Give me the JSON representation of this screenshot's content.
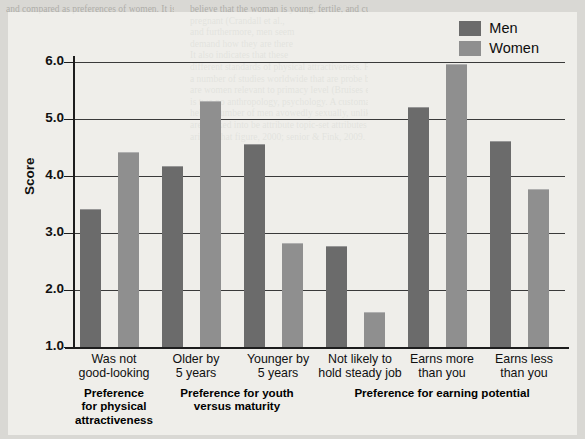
{
  "chart_data": {
    "type": "bar",
    "title": "",
    "xlabel": "",
    "ylabel": "Score",
    "ylim": [
      1.0,
      6.0
    ],
    "ytick_labels": [
      "6.0",
      "5.0",
      "4.0",
      "3.0",
      "2.0",
      "1.0"
    ],
    "ytick_values": [
      6.0,
      5.0,
      4.0,
      3.0,
      2.0,
      1.0
    ],
    "grid": "horizontal",
    "legend_position": "top-right",
    "categories": [
      "Was not good-looking",
      "Older by 5 years",
      "Younger by 5 years",
      "Not likely to hold steady job",
      "Earns more than you",
      "Earns less than you"
    ],
    "category_lines": [
      [
        "Was not",
        "good-looking"
      ],
      [
        "Older by",
        "5 years"
      ],
      [
        "Younger by",
        "5 years"
      ],
      [
        "Not likely to",
        "hold steady job"
      ],
      [
        "Earns more",
        "than you"
      ],
      [
        "Earns less",
        "than you"
      ]
    ],
    "series": [
      {
        "name": "Men",
        "color": "#6b6b6b",
        "values": [
          3.4,
          4.15,
          4.55,
          2.75,
          5.2,
          4.6
        ]
      },
      {
        "name": "Women",
        "color": "#8f8f8f",
        "values": [
          4.4,
          5.3,
          2.8,
          1.6,
          5.95,
          3.75
        ]
      }
    ],
    "sections": [
      {
        "lines": [
          "Preference",
          "for physical",
          "attractiveness"
        ],
        "spans": [
          0,
          0
        ]
      },
      {
        "lines": [
          "Preference for youth",
          "versus maturity"
        ],
        "spans": [
          1,
          2
        ]
      },
      {
        "lines": [
          "Preference for earning potential"
        ],
        "spans": [
          3,
          5
        ]
      }
    ]
  },
  "legend": {
    "items": [
      {
        "label": "Men",
        "color": "#6b6b6b"
      },
      {
        "label": "Women",
        "color": "#8f8f8f"
      }
    ]
  },
  "scan_bleed": {
    "column_1": [
      "and compared as preferences of women. It is high",
      "",
      "",
      "",
      "",
      "",
      "",
      "",
      "",
      "",
      "",
      "",
      "",
      "",
      "",
      "",
      "",
      "",
      "",
      "",
      "",
      "",
      "",
      "",
      "",
      "",
      "",
      "",
      "",
      "",
      "",
      "",
      "",
      "",
      "",
      "",
      ""
    ],
    "column_2": [
      "believe that the woman is young, fertile, and currently not",
      "pregnant (Crandall et al.,",
      "and furthermore, men seem",
      "demand how they are there",
      "It also indicates that these",
      "different standards of physical attractiveness. For",
      "a number of studies worldwide that are probe being to which one right and left",
      "are women relevant to primacy level (Bruises et al., the same findings, 2010,",
      "is two no anthropology, psychology. A customary pay-physiology isolated that and",
      "help a number of men avowedly sexually, unlike as given it height and the",
      "are nocked into be attribute topic-set attributes for development that in her a",
      "arising that figure, 2000; senior & Fink, 2009."
    ],
    "column_3": [
      "",
      "",
      "",
      "",
      "",
      "",
      "",
      "",
      "",
      "",
      "",
      "",
      "",
      "",
      "",
      "",
      "",
      "",
      "",
      "",
      "",
      "",
      "",
      "",
      "",
      "",
      "",
      "",
      "",
      "",
      "",
      "",
      "",
      "",
      "",
      "",
      ""
    ]
  }
}
